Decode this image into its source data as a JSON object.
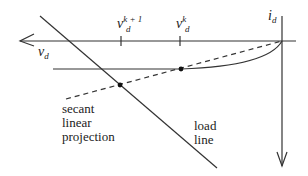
{
  "diagram": {
    "axes": {
      "x_label": "v",
      "x_label_sub": "d",
      "y_label": "i",
      "y_label_sub": "d"
    },
    "ticks": [
      {
        "base": "v",
        "sub": "d",
        "sup": "k + 1"
      },
      {
        "base": "v",
        "sub": "d",
        "sup": "k"
      }
    ],
    "labels": {
      "secant": [
        "secant",
        "linear",
        "projection"
      ],
      "load_line": [
        "load",
        "line"
      ]
    },
    "colors": {
      "line": "#333333",
      "background": "#ffffff"
    }
  }
}
